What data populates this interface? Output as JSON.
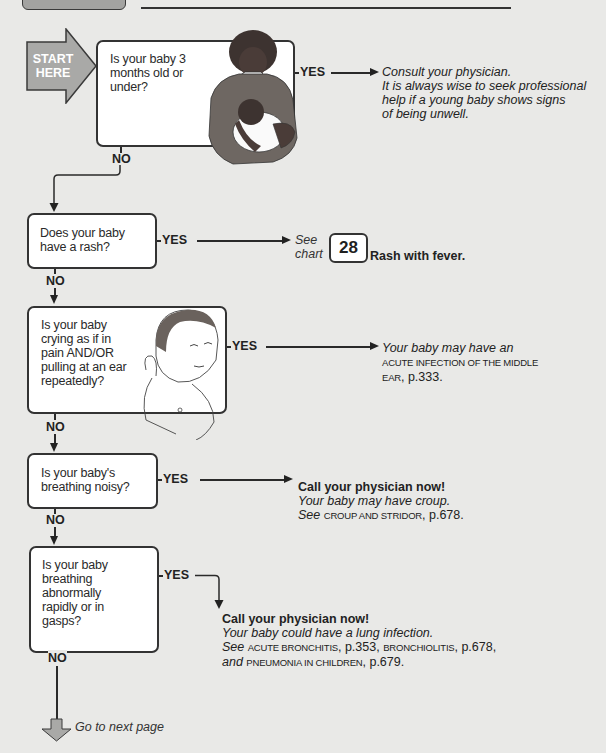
{
  "header": {
    "tab_label": "",
    "title": ""
  },
  "start": {
    "label_line1": "START",
    "label_line2": "HERE",
    "color": "#a9a9a7"
  },
  "questions": [
    {
      "id": "q1",
      "text_lines": [
        "Is your baby 3",
        "months old or",
        "under?"
      ],
      "yes_label": "YES",
      "no_label": "NO",
      "illustration": "mother-holding-baby"
    },
    {
      "id": "q2",
      "text_lines": [
        "Does your baby",
        "have a rash?"
      ],
      "yes_label": "YES",
      "no_label": "NO"
    },
    {
      "id": "q3",
      "text_lines": [
        "Is your baby",
        "crying as if in",
        "pain AND/OR",
        "pulling at an ear",
        "repeatedly?"
      ],
      "yes_label": "YES",
      "no_label": "NO",
      "illustration": "baby-pulling-ear"
    },
    {
      "id": "q4",
      "text_lines": [
        "Is your baby's",
        "breathing noisy?"
      ],
      "yes_label": "YES",
      "no_label": "NO"
    },
    {
      "id": "q5",
      "text_lines": [
        "Is your baby",
        "breathing",
        "abnormally",
        "rapidly or in",
        "gasps?"
      ],
      "yes_label": "YES",
      "no_label": "NO"
    }
  ],
  "answers": {
    "a1": {
      "line1": "Consult your physician.",
      "line2": "It is always wise to seek professional",
      "line3": "help if a young baby shows signs",
      "line4": "of being unwell."
    },
    "a2": {
      "see": "See",
      "chart": "chart",
      "chart_number": "28",
      "chart_title": "Rash with fever."
    },
    "a3": {
      "line1": "Your baby may have an",
      "line2": "ACUTE INFECTION OF THE MIDDLE",
      "line3_sc": "EAR",
      "line3_rest": ", p.333."
    },
    "a4": {
      "headline": "Call your physician now!",
      "line2": "Your baby may have croup.",
      "see": "See",
      "ref_sc": "CROUP AND STRIDOR",
      "ref_page": ", p.678."
    },
    "a5": {
      "headline": "Call your physician now!",
      "line2": "Your baby could have a lung infection.",
      "see": "See",
      "ref1_sc": "ACUTE BRONCHITIS",
      "ref1_page": ", p.353, ",
      "ref2_sc": "BRONCHIOLITIS",
      "ref2_page": ", p.678,",
      "and": "and",
      "ref3_sc": "PNEUMONIA IN CHILDREN",
      "ref3_page": ", p.679."
    }
  },
  "footer": {
    "next_page_label": "Go to next page"
  }
}
